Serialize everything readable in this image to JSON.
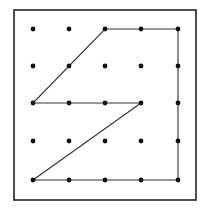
{
  "diagram": {
    "type": "geoboard",
    "grid": {
      "columns": 5,
      "rows": 5
    },
    "frame": {
      "x": 14,
      "y": 10,
      "width": 182,
      "height": 190,
      "stroke": "#222222"
    },
    "dot_color": "#111111",
    "line_color": "#333333",
    "col_x": [
      33,
      69,
      105,
      141,
      178
    ],
    "row_y": [
      29,
      66,
      103,
      141,
      180
    ],
    "polygon_vertices_grid": [
      [
        2,
        0
      ],
      [
        4,
        0
      ],
      [
        4,
        4
      ],
      [
        0,
        4
      ],
      [
        3,
        2
      ],
      [
        0,
        2
      ]
    ]
  }
}
